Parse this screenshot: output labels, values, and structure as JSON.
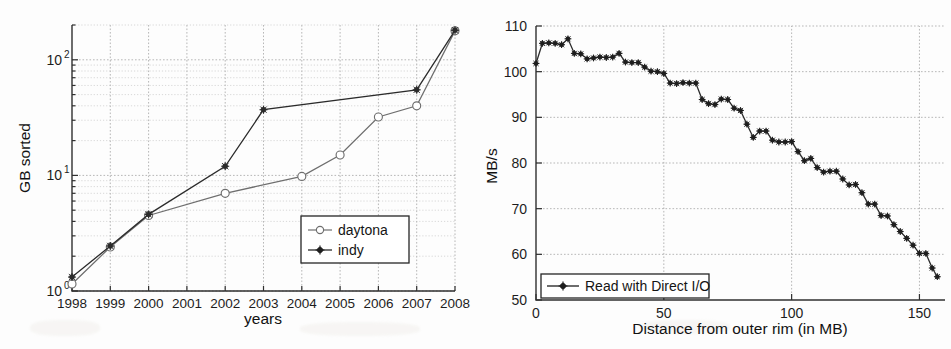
{
  "page": {
    "background": "#fdfdfd",
    "ink": "#1a1a1a",
    "width": 951,
    "height": 349
  },
  "figures": [
    {
      "id": "sort-benchmark-chart",
      "name": "gb-sorted-vs-years-chart"
    },
    {
      "id": "disk-throughput-chart",
      "name": "mbs-vs-distance-chart"
    }
  ],
  "chart_data": [
    {
      "type": "line",
      "title": "",
      "xlabel": "years",
      "ylabel": "GB sorted",
      "yscale": "log",
      "xscale": "linear",
      "grid": true,
      "legend_position": "lower right",
      "xlim": [
        1998,
        2008
      ],
      "ylim": [
        1,
        200
      ],
      "xticks": [
        "1998",
        "1999",
        "2000",
        "2001",
        "2002",
        "2003",
        "2004",
        "2005",
        "2006",
        "2007",
        "2008"
      ],
      "yticks": [
        "10^0",
        "10^1",
        "10^2"
      ],
      "ytick_mantissa": [
        "10",
        "10",
        "10"
      ],
      "ytick_exponent": [
        "0",
        "1",
        "2"
      ],
      "categories": [
        1998,
        1999,
        2000,
        2001,
        2002,
        2003,
        2004,
        2005,
        2006,
        2007,
        2008
      ],
      "series": [
        {
          "name": "daytona",
          "marker": "circle-open",
          "color": "#6e6e6e",
          "x": [
            1998,
            1999,
            2000,
            2002,
            2004,
            2005,
            2006,
            2007,
            2008
          ],
          "values": [
            1.15,
            2.4,
            4.5,
            7.0,
            9.8,
            15.0,
            32.0,
            40.0,
            178.0
          ]
        },
        {
          "name": "indy",
          "marker": "star-filled",
          "color": "#2b2b2b",
          "x": [
            1998,
            1999,
            2000,
            2002,
            2003,
            2007,
            2008
          ],
          "values": [
            1.32,
            2.45,
            4.6,
            12.0,
            37.0,
            55.0,
            180.0
          ]
        }
      ],
      "legend": [
        "daytona",
        "indy"
      ]
    },
    {
      "type": "line",
      "title": "",
      "xlabel": "Distance from outer rim (in MB)",
      "ylabel": "MB/s",
      "yscale": "linear",
      "xscale": "linear",
      "grid": true,
      "legend_position": "lower left",
      "xlim": [
        0,
        160
      ],
      "ylim": [
        50,
        110
      ],
      "xticks": [
        "0",
        "50",
        "100",
        "150"
      ],
      "xtick_values": [
        0,
        50,
        100,
        150
      ],
      "yticks": [
        "50",
        "60",
        "70",
        "80",
        "90",
        "100",
        "110"
      ],
      "ytick_values": [
        50,
        60,
        70,
        80,
        90,
        100,
        110
      ],
      "legend": [
        "Read with Direct I/O"
      ],
      "series": [
        {
          "name": "Read with Direct I/O",
          "marker": "star-filled",
          "color": "#1e1e1e",
          "x": [
            0,
            2.5,
            5,
            7.5,
            10,
            12.5,
            15,
            17.5,
            20,
            22.5,
            25,
            27.5,
            30,
            32.5,
            35,
            37.5,
            40,
            42.5,
            45,
            47.5,
            50,
            52.5,
            55,
            57.5,
            60,
            62.5,
            65,
            67.5,
            70,
            72.5,
            75,
            77.5,
            80,
            82.5,
            85,
            87.5,
            90,
            92.5,
            95,
            97.5,
            100,
            102.5,
            105,
            107.5,
            110,
            112.5,
            115,
            117.5,
            120,
            122.5,
            125,
            127.5,
            130,
            132.5,
            135,
            137.5,
            140,
            142.5,
            145,
            147.5,
            150,
            152.5,
            155,
            157
          ],
          "values": [
            101.8,
            106.2,
            106.3,
            106.2,
            105.9,
            107.2,
            104.0,
            103.9,
            102.8,
            103.0,
            103.2,
            103.1,
            103.2,
            104.0,
            102.1,
            102.0,
            102.0,
            101.0,
            100.1,
            100.0,
            99.6,
            97.5,
            97.4,
            97.6,
            97.5,
            97.5,
            93.9,
            93.0,
            92.8,
            94.0,
            93.9,
            92.0,
            91.5,
            88.5,
            85.6,
            87.0,
            87.0,
            85.0,
            84.6,
            84.6,
            84.7,
            82.5,
            80.5,
            81.0,
            79.0,
            78.0,
            78.2,
            78.2,
            76.5,
            75.2,
            75.3,
            73.5,
            71.0,
            71.0,
            68.5,
            68.4,
            66.5,
            65.0,
            63.5,
            62.0,
            60.2,
            60.2,
            57.0,
            55.1
          ]
        }
      ]
    }
  ]
}
